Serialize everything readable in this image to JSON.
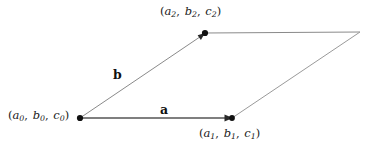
{
  "figure": {
    "type": "parallelogram-vector-diagram",
    "background_color": "#ffffff",
    "width": 372,
    "height": 149,
    "vertices": [
      {
        "id": "origin",
        "name": "vertex-a0-b0-c0",
        "x": 80,
        "y": 118,
        "has_dot": true,
        "dot_radius": 3.1,
        "label": {
          "open_paren": "(",
          "terms": [
            {
              "base": "a",
              "sub": "0"
            },
            {
              "base": "b",
              "sub": "0"
            },
            {
              "base": "c",
              "sub": "0"
            }
          ],
          "separator": ",",
          "close_paren": ")",
          "text": "(a0, b0, c0)"
        }
      },
      {
        "id": "tip-a",
        "name": "vertex-a1-b1-c1",
        "x": 232,
        "y": 118,
        "has_dot": true,
        "dot_radius": 2.9,
        "label": {
          "open_paren": "(",
          "terms": [
            {
              "base": "a",
              "sub": "1"
            },
            {
              "base": "b",
              "sub": "1"
            },
            {
              "base": "c",
              "sub": "1"
            }
          ],
          "separator": ",",
          "close_paren": ")",
          "text": "(a1, b1, c1)"
        }
      },
      {
        "id": "tip-b",
        "name": "vertex-a2-b2-c2",
        "x": 205,
        "y": 33,
        "has_dot": true,
        "dot_radius": 3.1,
        "label": {
          "open_paren": "(",
          "terms": [
            {
              "base": "a",
              "sub": "2"
            },
            {
              "base": "b",
              "sub": "2"
            },
            {
              "base": "c",
              "sub": "2"
            }
          ],
          "separator": ",",
          "close_paren": ")",
          "text": "(a2, b2, c2)"
        }
      },
      {
        "id": "far-corner",
        "name": "vertex-far-corner",
        "x": 360,
        "y": 32,
        "has_dot": false,
        "label": null
      }
    ],
    "edges": [
      {
        "id": "edge-a",
        "name": "vector-a-edge",
        "from": "origin",
        "to": "tip-a",
        "color": "#555555",
        "width": 1.5,
        "arrowhead": true
      },
      {
        "id": "edge-b",
        "name": "vector-b-edge",
        "from": "origin",
        "to": "tip-b",
        "color": "#8a8a8a",
        "width": 1.0,
        "arrowhead": true
      },
      {
        "id": "edge-top",
        "name": "parallelogram-top-edge",
        "from": "tip-b",
        "to": "far-corner",
        "color": "#8a8a8a",
        "width": 1.0,
        "arrowhead": false
      },
      {
        "id": "edge-right",
        "name": "parallelogram-right-edge",
        "from": "far-corner",
        "to": "tip-a",
        "color": "#9a9a9a",
        "width": 1.0,
        "arrowhead": false
      }
    ],
    "vector_labels": [
      {
        "id": "vec-a",
        "name": "vector-label-a",
        "text": "a",
        "x": 160,
        "y": 104,
        "bold": true
      },
      {
        "id": "vec-b",
        "name": "vector-label-b",
        "text": "b",
        "x": 113,
        "y": 69,
        "bold": true
      }
    ]
  }
}
